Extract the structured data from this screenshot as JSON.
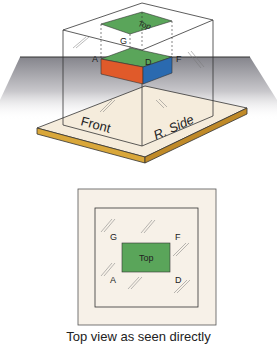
{
  "diagram": {
    "type": "orthographic-projection-glass-box",
    "colors": {
      "top_face": "#5aa55a",
      "front_face": "#e05a2a",
      "side_face": "#2a6ab0",
      "base_plate": "#f5ecdc",
      "base_edge": "#d9a73a",
      "panel_bg": "#f7f1e8",
      "plane_gradient_top": "#8a8a90",
      "plane_gradient_bottom": "#ffffff",
      "line": "#333333"
    },
    "iso_view": {
      "top_label": "Top",
      "points": [
        "G",
        "A",
        "D",
        "F"
      ],
      "point_labels": {
        "G": "G",
        "A": "A",
        "D": "D",
        "F": "F"
      },
      "front_label": "Front",
      "side_label": "R. Side"
    },
    "top_view": {
      "top_label": "Top",
      "corner_labels": {
        "G": "G",
        "F": "F",
        "A": "A",
        "D": "D"
      }
    },
    "caption": "Top view as seen directly"
  }
}
